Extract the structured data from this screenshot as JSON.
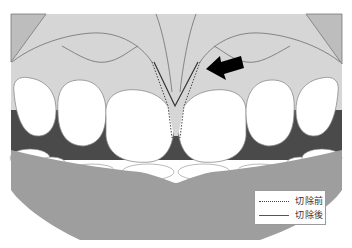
{
  "figure": {
    "colors": {
      "background": "#ffffff",
      "gingiva": "#d6d6d6",
      "gingiva_corner": "#bdbdbd",
      "tooth": "#ffffff",
      "tooth_outline": "#8a8a8a",
      "mouth_interior": "#4a4a4a",
      "lower_lip": "#9e9e9e",
      "arrow": "#000000",
      "line_before": "#444444",
      "line_after": "#333333"
    },
    "arrow": {
      "icon": "arrow-pointing-to-frenum",
      "direction": "down-left"
    }
  },
  "legend": {
    "items": [
      {
        "style": "dotted",
        "label": "切除前"
      },
      {
        "style": "solid",
        "label": "切除後"
      }
    ]
  }
}
